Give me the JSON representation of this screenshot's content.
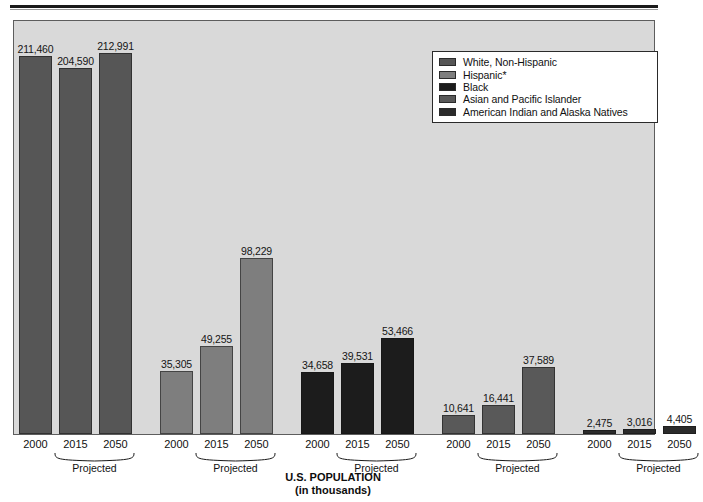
{
  "chart_data": {
    "type": "bar",
    "title": "U.S. POPULATION",
    "subtitle": "(in thousands)",
    "xlabel": "",
    "ylabel": "",
    "ylim": [
      0,
      212991
    ],
    "grid": false,
    "legend_position": "top-right",
    "categories": [
      "2000",
      "2015",
      "2050"
    ],
    "projected_categories": [
      "2015",
      "2050"
    ],
    "projected_label": "Projected",
    "series": [
      {
        "name": "White, Non-Hispanic",
        "color": "#565656",
        "values": [
          211460,
          204590,
          212991
        ],
        "value_labels": [
          "211,460",
          "204,590",
          "212,991"
        ]
      },
      {
        "name": "Hispanic*",
        "color": "#7e7e7e",
        "values": [
          35305,
          49255,
          98229
        ],
        "value_labels": [
          "35,305",
          "49,255",
          "98,229"
        ]
      },
      {
        "name": "Black",
        "color": "#1c1c1c",
        "values": [
          34658,
          39531,
          53466
        ],
        "value_labels": [
          "34,658",
          "39,531",
          "53,466"
        ]
      },
      {
        "name": "Asian and Pacific Islander",
        "color": "#595959",
        "values": [
          10641,
          16441,
          37589
        ],
        "value_labels": [
          "10,641",
          "16,441",
          "37,589"
        ]
      },
      {
        "name": "American Indian and Alaska Natives",
        "color": "#2b2b2b",
        "values": [
          2475,
          3016,
          4405
        ],
        "value_labels": [
          "2,475",
          "3,016",
          "4,405"
        ]
      }
    ]
  },
  "legend": {
    "items": [
      {
        "label": "White, Non-Hispanic",
        "color": "#565656"
      },
      {
        "label": "Hispanic*",
        "color": "#7e7e7e"
      },
      {
        "label": "Black",
        "color": "#1c1c1c"
      },
      {
        "label": "Asian and Pacific Islander",
        "color": "#595959"
      },
      {
        "label": "American Indian and Alaska Natives",
        "color": "#2b2b2b"
      }
    ]
  },
  "title": {
    "line1": "U.S. POPULATION",
    "line2": "(in thousands)"
  },
  "axis": {
    "group_years": [
      "2000",
      "2015",
      "2050"
    ],
    "projected_label": "Projected"
  },
  "colors": {
    "plot_background": "#d9d9d9",
    "frame_border": "#5d5d5d",
    "page_background": "#ffffff",
    "rule": "#1b1b1b"
  }
}
